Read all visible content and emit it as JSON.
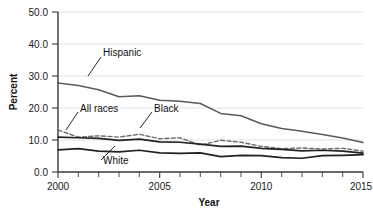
{
  "chart_data": {
    "type": "line",
    "title": "",
    "xlabel": "Year",
    "ylabel": "Percent",
    "xlim": [
      2000,
      2015
    ],
    "ylim": [
      0,
      50
    ],
    "grid": "horizontal",
    "legend": "inline-labels",
    "x": [
      2000,
      2001,
      2002,
      2003,
      2004,
      2005,
      2006,
      2007,
      2008,
      2009,
      2010,
      2011,
      2012,
      2013,
      2014,
      2015
    ],
    "ytick_labels": [
      "0.0",
      "10.0",
      "20.0",
      "30.0",
      "40.0",
      "50.0"
    ],
    "ytick_values": [
      0,
      10,
      20,
      30,
      40,
      50
    ],
    "xtick_labels": [
      "2000",
      "2005",
      "2010",
      "2015"
    ],
    "xtick_values": [
      2000,
      2005,
      2010,
      2015
    ],
    "series": [
      {
        "name": "Hispanic",
        "style": "solid",
        "color": "#5a5a5a",
        "values": [
          27.8,
          27.0,
          25.7,
          23.5,
          23.8,
          22.4,
          22.1,
          21.4,
          18.3,
          17.6,
          15.1,
          13.6,
          12.7,
          11.7,
          10.6,
          9.2
        ]
      },
      {
        "name": "Black",
        "style": "dashed",
        "color": "#6b6b6b",
        "values": [
          13.1,
          10.9,
          11.3,
          10.9,
          11.8,
          10.4,
          10.7,
          8.4,
          9.9,
          9.3,
          8.0,
          7.3,
          7.5,
          7.2,
          7.4,
          6.5
        ]
      },
      {
        "name": "All races",
        "style": "solid",
        "color": "#222222",
        "values": [
          10.9,
          10.7,
          10.5,
          9.9,
          10.3,
          9.4,
          9.3,
          8.7,
          8.0,
          8.1,
          7.4,
          7.1,
          6.6,
          6.8,
          6.5,
          5.9
        ]
      },
      {
        "name": "White",
        "style": "solid",
        "color": "#222222",
        "values": [
          6.9,
          7.3,
          6.5,
          6.3,
          6.8,
          6.0,
          5.8,
          6.0,
          4.8,
          5.2,
          5.1,
          4.5,
          4.3,
          5.1,
          5.2,
          5.4
        ]
      }
    ],
    "annotations": [
      {
        "text": "Hispanic",
        "for": "Hispanic"
      },
      {
        "text": "All races",
        "for": "All races"
      },
      {
        "text": "Black",
        "for": "Black"
      },
      {
        "text": "White",
        "for": "White"
      }
    ]
  }
}
